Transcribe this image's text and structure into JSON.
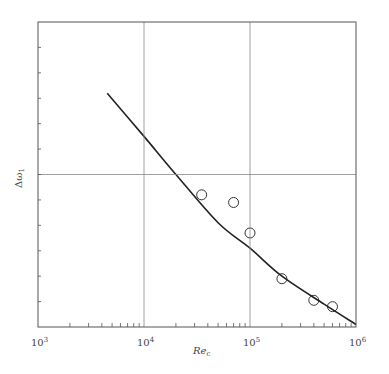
{
  "chart_data": {
    "type": "scatter",
    "title": "",
    "xlabel": "Re_c",
    "xlabel_main": "Re",
    "xlabel_sub": "c",
    "ylabel": "Δω1",
    "ylabel_main": "Δω",
    "ylabel_sub": "1",
    "xscale": "log",
    "xlim": [
      1000,
      1000000
    ],
    "ylim": [
      0,
      12
    ],
    "x_tick_labels": [
      {
        "base": "10",
        "exp": "3",
        "value": 1000
      },
      {
        "base": "10",
        "exp": "4",
        "value": 10000
      },
      {
        "base": "10",
        "exp": "5",
        "value": 100000
      },
      {
        "base": "10",
        "exp": "6",
        "value": 1000000
      }
    ],
    "y_tick_labels": [],
    "grid": {
      "vertical": [
        10000,
        100000
      ],
      "horizontal": [
        6
      ]
    },
    "legend": null,
    "series": [
      {
        "name": "data (open circles)",
        "kind": "scatter",
        "x": [
          35000,
          70000,
          100000,
          200000,
          400000,
          600000
        ],
        "y": [
          5.2,
          4.9,
          3.7,
          1.9,
          1.05,
          0.8
        ]
      },
      {
        "name": "fit curve",
        "kind": "line",
        "x": [
          4500,
          10000,
          20000,
          50000,
          100000,
          200000,
          500000,
          1000000
        ],
        "y": [
          9.2,
          7.5,
          6.0,
          4.1,
          3.1,
          2.0,
          0.9,
          0.1
        ]
      }
    ]
  }
}
